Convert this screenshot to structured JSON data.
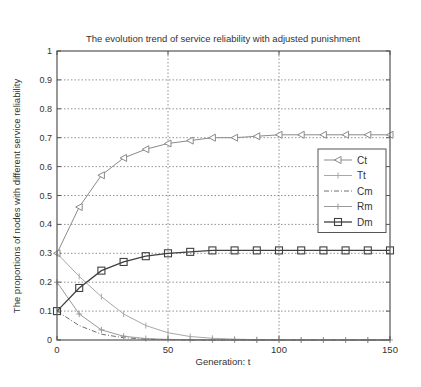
{
  "chart_data": {
    "type": "line",
    "title": "The evolution trend of service reliability with adjusted punishment",
    "xlabel": "Generation: t",
    "ylabel": "The proportions of nodes with different service reliability",
    "xlim": [
      0,
      150
    ],
    "ylim": [
      0,
      1
    ],
    "xticks": [
      0,
      50,
      100,
      150
    ],
    "yticks": [
      0,
      0.1,
      0.2,
      0.3,
      0.4,
      0.5,
      0.6,
      0.7,
      0.8,
      0.9,
      1
    ],
    "ytick_labels": [
      "0",
      "0.1",
      "0.2",
      "0.3",
      "0.4",
      "0.5",
      "0.6",
      "0.7",
      "0.8",
      "0.9",
      "1"
    ],
    "grid": true,
    "legend_position": "right-middle inside",
    "x": [
      0,
      10,
      20,
      30,
      40,
      50,
      60,
      70,
      80,
      90,
      100,
      110,
      120,
      130,
      140,
      150
    ],
    "series": [
      {
        "name": "Ct",
        "marker": "triangle-left",
        "line": "solid",
        "color": "#8a8a8a",
        "values": [
          0.3,
          0.46,
          0.57,
          0.63,
          0.66,
          0.68,
          0.69,
          0.7,
          0.7,
          0.705,
          0.71,
          0.71,
          0.71,
          0.71,
          0.71,
          0.71
        ]
      },
      {
        "name": "Tt",
        "marker": "vertical-tick",
        "line": "solid",
        "color": "#a8a8a8",
        "values": [
          0.3,
          0.22,
          0.15,
          0.09,
          0.05,
          0.025,
          0.012,
          0.006,
          0.003,
          0.001,
          0,
          0,
          0,
          0,
          0,
          0
        ]
      },
      {
        "name": "Cm",
        "marker": "none",
        "line": "dash-dot",
        "color": "#707070",
        "values": [
          0.1,
          0.05,
          0.02,
          0.008,
          0.003,
          0.001,
          0,
          0,
          0,
          0,
          0,
          0,
          0,
          0,
          0,
          0
        ]
      },
      {
        "name": "Rm",
        "marker": "plus",
        "line": "solid",
        "color": "#9a9a9a",
        "values": [
          0.2,
          0.09,
          0.035,
          0.013,
          0.005,
          0.002,
          0.001,
          0,
          0,
          0,
          0,
          0,
          0,
          0,
          0,
          0
        ]
      },
      {
        "name": "Dm",
        "marker": "square",
        "line": "solid",
        "color": "#404040",
        "values": [
          0.1,
          0.18,
          0.24,
          0.27,
          0.29,
          0.3,
          0.305,
          0.31,
          0.31,
          0.31,
          0.31,
          0.31,
          0.31,
          0.31,
          0.31,
          0.31
        ]
      }
    ]
  }
}
